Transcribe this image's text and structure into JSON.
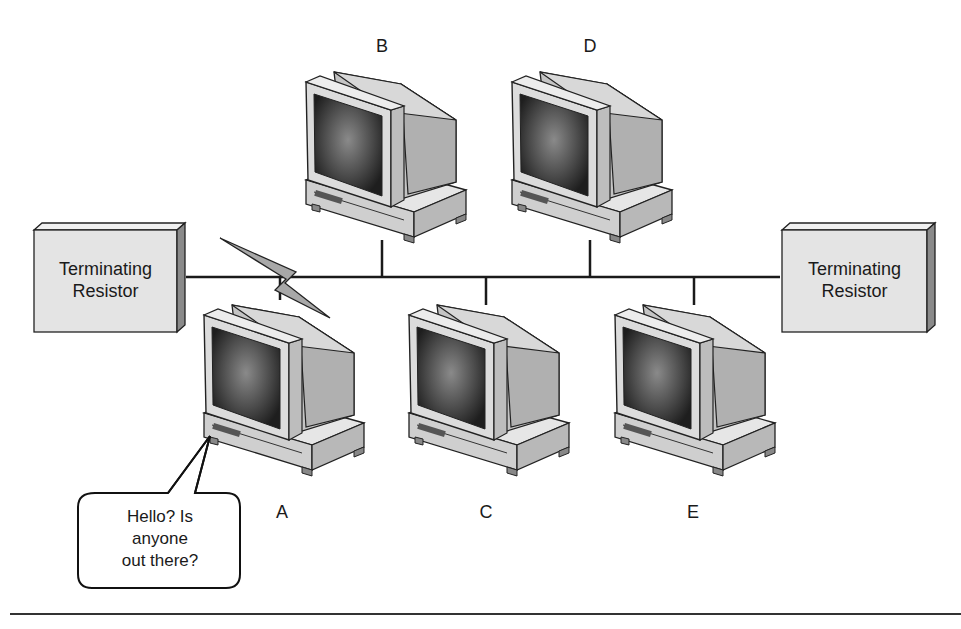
{
  "diagram": {
    "type": "bus-network-collision",
    "terminators": [
      {
        "id": "left",
        "line1": "Terminating",
        "line2": "Resistor"
      },
      {
        "id": "right",
        "line1": "Terminating",
        "line2": "Resistor"
      }
    ],
    "computers": [
      {
        "id": "A",
        "label": "A",
        "position": "below-bus"
      },
      {
        "id": "B",
        "label": "B",
        "position": "above-bus"
      },
      {
        "id": "C",
        "label": "C",
        "position": "below-bus"
      },
      {
        "id": "D",
        "label": "D",
        "position": "above-bus"
      },
      {
        "id": "E",
        "label": "E",
        "position": "below-bus"
      }
    ],
    "speech_bubble": {
      "line1": "Hello? Is",
      "line2": "anyone",
      "line3": "out there?"
    },
    "break_indicator": "lightning-bolt",
    "colors": {
      "line": "#1a1a1a",
      "box_fill": "#e4e4e4",
      "box_side": "#8a8a8a",
      "monitor_light": "#d6d6d6",
      "screen_dark": "#3a3a3a"
    }
  }
}
